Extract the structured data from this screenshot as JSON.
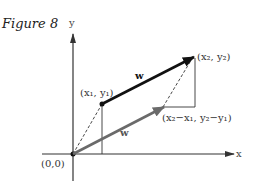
{
  "figure": {
    "title": "Figure 8",
    "x_axis_label": "x",
    "y_axis_label": "y",
    "origin_label": "(0,0)",
    "points": {
      "p1_label": "(x₁, y₁)",
      "p2_label": "(x₂, y₂)",
      "diff_label": "(x₂−x₁, y₂−y₁)"
    },
    "vectors": {
      "upper_label": "w",
      "lower_label": "w",
      "upper_color": "#111111",
      "lower_color": "#6a6a6a"
    }
  }
}
